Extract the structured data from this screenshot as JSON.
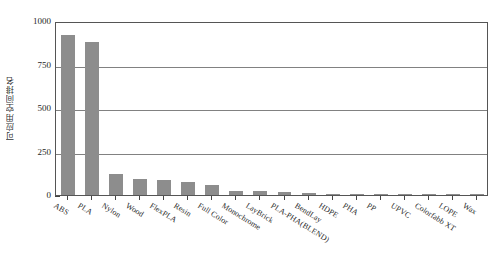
{
  "chart_data": {
    "type": "bar",
    "title": "",
    "xlabel": "",
    "ylabel": "可应用空间排名",
    "ylim": [
      0,
      1000
    ],
    "yticks": [
      0,
      250,
      500,
      750,
      1000
    ],
    "ytick_labels": [
      "0",
      "250",
      "500",
      "750",
      "1000"
    ],
    "grid": true,
    "grid_axis": "y",
    "legend": false,
    "bar_color": "#8d8d8d",
    "categories": [
      "ABS",
      "PLA",
      "Nylon",
      "Wood",
      "FlexPLA",
      "Resin",
      "Full Color",
      "Monochrome",
      "LayBrick",
      "PLA-PHA(BLEND)",
      "BendLay",
      "HDPE",
      "PHA",
      "PP",
      "UPVC",
      "Colorfabb XT",
      "LOPE",
      "Wax"
    ],
    "values": [
      920,
      880,
      120,
      90,
      88,
      75,
      55,
      25,
      22,
      20,
      12,
      8,
      7,
      6,
      3,
      3,
      2,
      2
    ]
  },
  "caption": {
    "text": ""
  }
}
